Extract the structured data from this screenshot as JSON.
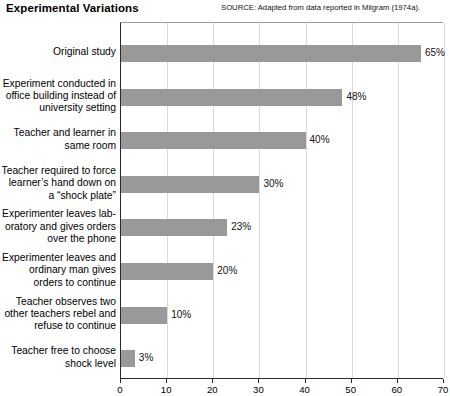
{
  "header": {
    "title": "Experimental Variations",
    "source": "SOURCE: Adapted from data reported in Milgram (1974a)."
  },
  "chart_data": {
    "type": "bar",
    "orientation": "horizontal",
    "title": "Experimental Variations",
    "xlabel": "",
    "ylabel": "",
    "xlim": [
      0,
      70
    ],
    "xticks": [
      0,
      10,
      20,
      30,
      40,
      50,
      60,
      70
    ],
    "grid": true,
    "legend": "none",
    "bar_color": "#999999",
    "value_suffix": "%",
    "categories": [
      "Original study",
      "Experiment conducted in office building instead of university setting",
      "Teacher and learner in same room",
      "Teacher required to force learner’s hand down on a “shock plate”",
      "Experimenter leaves laboratory and gives orders over the phone",
      "Experimenter leaves and ordinary man gives orders to continue",
      "Teacher observes two other teachers rebel and refuse to continue",
      "Teacher free to choose shock level"
    ],
    "values": [
      65,
      48,
      40,
      30,
      23,
      20,
      10,
      3
    ],
    "value_labels": [
      "65%",
      "48%",
      "40%",
      "30%",
      "23%",
      "20%",
      "10%",
      "3%"
    ],
    "category_lines": [
      [
        "Original study"
      ],
      [
        "Experiment conducted in",
        "office building instead of",
        "university setting"
      ],
      [
        "Teacher and learner in",
        "same room"
      ],
      [
        "Teacher required to force",
        "learner’s hand down on",
        "a “shock plate”"
      ],
      [
        "Experimenter leaves lab-",
        "oratory and gives orders",
        "over the phone"
      ],
      [
        "Experimenter leaves and",
        "ordinary man gives",
        "orders to continue"
      ],
      [
        "Teacher observes two",
        "other teachers rebel and",
        "refuse to continue"
      ],
      [
        "Teacher free to choose",
        "shock level"
      ]
    ],
    "annotations": [
      "SOURCE: Adapted from data reported in Milgram (1974a)."
    ]
  }
}
